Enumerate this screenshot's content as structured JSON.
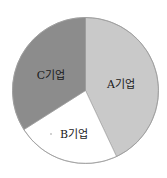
{
  "chart_data": {
    "type": "pie",
    "title": "",
    "categories": [
      "A기업",
      "B기업",
      "C기업"
    ],
    "values": [
      43,
      23,
      34
    ],
    "unit": "%",
    "start_angle_deg": 0,
    "direction": "clockwise",
    "colors": [
      "#c9c9c9",
      "#ffffff",
      "#8c8c8c"
    ],
    "legend": "none",
    "labels_inside": true
  },
  "geometry": {
    "cx": 85.5,
    "cy": 90.5,
    "r": 73
  },
  "labels": {
    "a": "A기업",
    "b": "B기업",
    "c": "C기업"
  },
  "style": {
    "outline": "#9a9a9a",
    "text": "#1a1a1a"
  }
}
